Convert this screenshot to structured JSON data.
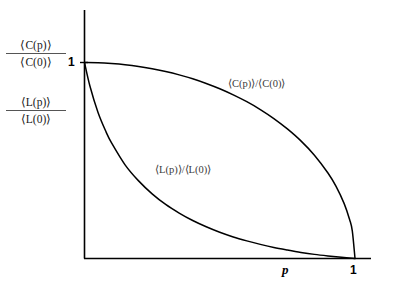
{
  "figure": {
    "name": "small-world-network-properties",
    "background_color": "#ffffff",
    "line_color": "#000000"
  },
  "axes": {
    "y_label_clustering_num": "⟨C(p)⟩",
    "y_label_clustering_den": "⟨C(0)⟩",
    "y_label_pathlength_num": "⟨L(p)⟩",
    "y_label_pathlength_den": "⟨L(0)⟩",
    "y_tick_one": "1",
    "x_tick_one": "1",
    "x_axis_variable": "p"
  },
  "annotations": {
    "clustering_curve": "⟨C(p)⟩/⟨C(0)⟩",
    "pathlength_curve": "⟨L(p)⟩/⟨L(0)⟩"
  },
  "chart_data": {
    "type": "line",
    "title": "",
    "xlabel": "p",
    "ylabel": "",
    "xlim": [
      0,
      1
    ],
    "ylim": [
      0,
      1
    ],
    "grid": false,
    "legend": "inline-curve-labels",
    "x_tick_labels": [
      "1"
    ],
    "y_tick_labels": [
      "1"
    ],
    "series": [
      {
        "name": "⟨C(p)⟩/⟨C(0)⟩",
        "color": "#000000",
        "description": "Clustering coefficient normalized; remains near 1 for small p then falls steeply to 0 at p = 1",
        "x": [
          0.0,
          0.05,
          0.1,
          0.15,
          0.2,
          0.25,
          0.3,
          0.35,
          0.4,
          0.45,
          0.5,
          0.55,
          0.6,
          0.65,
          0.7,
          0.75,
          0.8,
          0.85,
          0.9,
          0.93,
          0.96,
          0.98,
          0.99,
          1.0
        ],
        "y": [
          1.0,
          0.999,
          0.995,
          0.989,
          0.98,
          0.968,
          0.954,
          0.937,
          0.917,
          0.893,
          0.866,
          0.835,
          0.8,
          0.76,
          0.714,
          0.661,
          0.6,
          0.527,
          0.436,
          0.368,
          0.28,
          0.199,
          0.141,
          0.0
        ]
      },
      {
        "name": "⟨L(p)⟩/⟨L(0)⟩",
        "color": "#000000",
        "description": "Characteristic path length normalized; drops rapidly for very small p then flattens toward 0",
        "x": [
          0.0,
          0.02,
          0.05,
          0.08,
          0.1,
          0.15,
          0.2,
          0.25,
          0.3,
          0.35,
          0.4,
          0.45,
          0.5,
          0.55,
          0.6,
          0.65,
          0.7,
          0.75,
          0.8,
          0.85,
          0.9,
          0.95,
          1.0
        ],
        "y": [
          1.0,
          0.88,
          0.745,
          0.645,
          0.59,
          0.478,
          0.396,
          0.33,
          0.276,
          0.232,
          0.194,
          0.162,
          0.134,
          0.11,
          0.09,
          0.072,
          0.056,
          0.043,
          0.031,
          0.021,
          0.013,
          0.006,
          0.0
        ]
      }
    ]
  }
}
